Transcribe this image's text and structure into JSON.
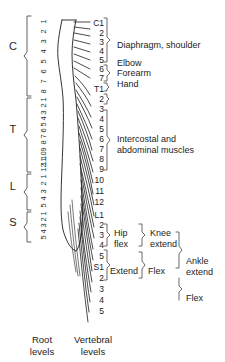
{
  "figure": {
    "ink_color": "#1c1c1c",
    "background": "#ffffff"
  },
  "root_levels": {
    "caption": "Root\nlevels",
    "sections": [
      {
        "letter": "C",
        "name": "cervical",
        "numbers": [
          "1",
          "2",
          "3",
          "4",
          "5",
          "6",
          "7",
          "8"
        ]
      },
      {
        "letter": "T",
        "name": "thoracic",
        "numbers": [
          "1",
          "2",
          "3",
          "4",
          "5",
          "6",
          "7",
          "8",
          "9",
          "10",
          "11",
          "12"
        ]
      },
      {
        "letter": "L",
        "name": "lumbar",
        "numbers": [
          "1",
          "2",
          "3",
          "4",
          "5"
        ]
      },
      {
        "letter": "S",
        "name": "sacral",
        "numbers": [
          "1",
          "2",
          "3",
          "4",
          "5"
        ]
      }
    ]
  },
  "vertebral_levels": {
    "caption": "Vertebral\nlevels",
    "numbers": [
      "C1",
      "2",
      "3",
      "4",
      "5",
      "6",
      "7",
      "T1",
      "2",
      "3",
      "4",
      "5",
      "6",
      "7",
      "8",
      "9",
      "10",
      "11",
      "12",
      "L1",
      "2",
      "3",
      "4",
      "5",
      "S1",
      "2",
      "3",
      "4",
      "5"
    ]
  },
  "function_labels": [
    {
      "id": "diaphragm-shoulder",
      "text": "Diaphragm, shoulder"
    },
    {
      "id": "elbow",
      "text": "Elbow"
    },
    {
      "id": "forearm",
      "text": "Forearm"
    },
    {
      "id": "hand",
      "text": "Hand"
    },
    {
      "id": "intercostal-abdominal",
      "line1": "Intercostal and",
      "line2": "abdominal muscles"
    },
    {
      "id": "hip-flex",
      "line1": "Hip",
      "line2": "flex"
    },
    {
      "id": "knee-extend",
      "line1": "Knee",
      "line2": "extend"
    },
    {
      "id": "extend",
      "text": "Extend"
    },
    {
      "id": "flex-mid",
      "text": "Flex"
    },
    {
      "id": "ankle-extend",
      "line1": "Ankle",
      "line2": "extend"
    },
    {
      "id": "flex-low",
      "text": "Flex"
    }
  ]
}
